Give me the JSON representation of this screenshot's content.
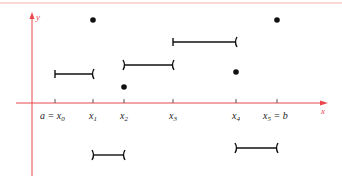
{
  "diagram": {
    "colors": {
      "axis": "#e8484c",
      "ink": "#111111",
      "frame": "#f0a0a0"
    },
    "axes": {
      "x_label": "x",
      "y_label": "y"
    },
    "tick_labels": [
      {
        "id": "x0",
        "text": "a = x",
        "sub": "0"
      },
      {
        "id": "x1",
        "text": "x",
        "sub": "1"
      },
      {
        "id": "x2",
        "text": "x",
        "sub": "2"
      },
      {
        "id": "x3",
        "text": "x",
        "sub": "3"
      },
      {
        "id": "x4",
        "text": "x",
        "sub": "4"
      },
      {
        "id": "x5",
        "text": "x",
        "sub": "5",
        "suffix": " = b"
      }
    ],
    "segments": [
      {
        "from": "x0",
        "to": "x1",
        "left": "closed",
        "right": "open"
      },
      {
        "from": "x1",
        "to": "x2",
        "left": "open",
        "right": "open"
      },
      {
        "from": "x2",
        "to": "x3",
        "left": "open",
        "right": "open"
      },
      {
        "from": "x3",
        "to": "x4",
        "left": "closed",
        "right": "open"
      },
      {
        "from": "x4",
        "to": "x5",
        "left": "open",
        "right": "open"
      }
    ],
    "points": [
      "x1",
      "x2",
      "x4",
      "x5"
    ]
  }
}
